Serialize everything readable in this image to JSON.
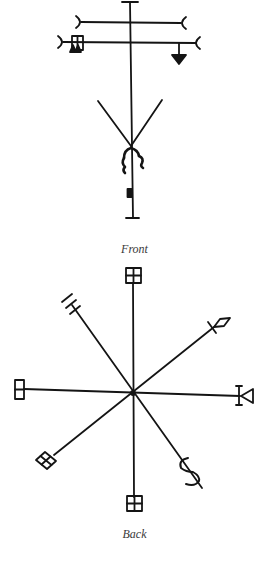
{
  "figure": {
    "front": {
      "caption": "Front",
      "description": "Vertical stave with two crossbars ending in crescents, box glyph, down-pointing arrow, V-shaped lines, hooks and small block"
    },
    "back": {
      "caption": "Back",
      "description": "Eight-spoked sigil with terminal glyphs: boxes, arrow fletching, diamond, bell/trumpet, lattice and S-curl"
    }
  },
  "colors": {
    "ink": "#141414",
    "background": "#ffffff",
    "caption": "#3a3a3a"
  }
}
